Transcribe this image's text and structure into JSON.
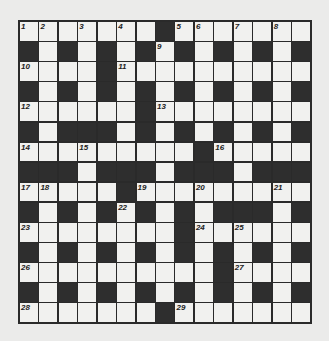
{
  "puzzle": {
    "rows": 15,
    "cols": 15,
    "grid": [
      "WWWWWWWBWWWWWWW",
      "BWBWBWBWBWBWBWB",
      "WWWWBWWWWWWWWWW",
      "BWBWBWBWBWBWBWB",
      "WWWWWWBWWWWWWWW",
      "BWBBBWBWBWBWBWB",
      "WWWWWWWWWBWWWWW",
      "BBBWBBBWBBBWBBB",
      "WWWWWBWWWWWWWWW",
      "BWBWBWBWBWBBBWB",
      "WWWWWWWWBWWWWWW",
      "BWBWBWBWBWBWBWB",
      "WWWWWWWWWWBWWWW",
      "BWBWBWBWBWBWBWB",
      "WWWWWWWBWWWWWWW"
    ],
    "numbers": [
      {
        "r": 0,
        "c": 0,
        "n": "1"
      },
      {
        "r": 0,
        "c": 1,
        "n": "2"
      },
      {
        "r": 0,
        "c": 3,
        "n": "3"
      },
      {
        "r": 0,
        "c": 5,
        "n": "4"
      },
      {
        "r": 0,
        "c": 8,
        "n": "5"
      },
      {
        "r": 0,
        "c": 9,
        "n": "6"
      },
      {
        "r": 0,
        "c": 11,
        "n": "7"
      },
      {
        "r": 0,
        "c": 13,
        "n": "8"
      },
      {
        "r": 1,
        "c": 7,
        "n": "9"
      },
      {
        "r": 2,
        "c": 0,
        "n": "10"
      },
      {
        "r": 2,
        "c": 5,
        "n": "11"
      },
      {
        "r": 4,
        "c": 0,
        "n": "12"
      },
      {
        "r": 4,
        "c": 7,
        "n": "13"
      },
      {
        "r": 6,
        "c": 0,
        "n": "14"
      },
      {
        "r": 6,
        "c": 3,
        "n": "15"
      },
      {
        "r": 6,
        "c": 10,
        "n": "16"
      },
      {
        "r": 8,
        "c": 0,
        "n": "17"
      },
      {
        "r": 8,
        "c": 1,
        "n": "18"
      },
      {
        "r": 8,
        "c": 6,
        "n": "19"
      },
      {
        "r": 8,
        "c": 9,
        "n": "20"
      },
      {
        "r": 8,
        "c": 13,
        "n": "21"
      },
      {
        "r": 9,
        "c": 5,
        "n": "22"
      },
      {
        "r": 10,
        "c": 0,
        "n": "23"
      },
      {
        "r": 10,
        "c": 9,
        "n": "24"
      },
      {
        "r": 10,
        "c": 11,
        "n": "25"
      },
      {
        "r": 12,
        "c": 0,
        "n": "26"
      },
      {
        "r": 12,
        "c": 11,
        "n": "27"
      },
      {
        "r": 14,
        "c": 0,
        "n": "28"
      },
      {
        "r": 14,
        "c": 8,
        "n": "29"
      }
    ]
  }
}
